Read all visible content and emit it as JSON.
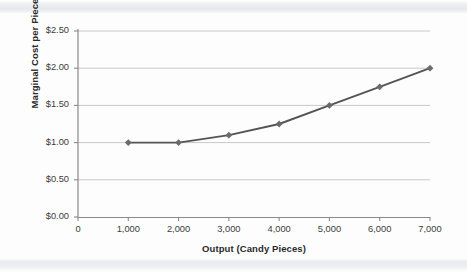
{
  "chart_data": {
    "type": "line",
    "title": "",
    "xlabel": "Output (Candy Pieces)",
    "ylabel": "Marginal Cost per Piece",
    "x": [
      1000,
      2000,
      3000,
      4000,
      5000,
      6000,
      7000
    ],
    "values": [
      1.0,
      1.0,
      1.1,
      1.25,
      1.5,
      1.75,
      2.0
    ],
    "series": [
      {
        "name": "Marginal Cost",
        "values": [
          1.0,
          1.0,
          1.1,
          1.25,
          1.5,
          1.75,
          2.0
        ]
      }
    ],
    "xlim": [
      0,
      7000
    ],
    "ylim": [
      0,
      2.5
    ],
    "xticks": [
      0,
      1000,
      2000,
      3000,
      4000,
      5000,
      6000,
      7000
    ],
    "xtick_labels": [
      "0",
      "1,000",
      "2,000",
      "3,000",
      "4,000",
      "5,000",
      "6,000",
      "7,000"
    ],
    "yticks": [
      0,
      0.5,
      1.0,
      1.5,
      2.0,
      2.5
    ],
    "ytick_labels": [
      "$0.00",
      "$0.50",
      "$1.00",
      "$1.50",
      "$2.00",
      "$2.50"
    ],
    "grid": "horizontal",
    "legend": "none",
    "marker": "diamond",
    "line_color": "#545454",
    "marker_color": "#6b6b6b",
    "grid_color": "#c8c8c8",
    "axis_color": "#8a8a8a",
    "background_color": "#fdfdfd"
  }
}
